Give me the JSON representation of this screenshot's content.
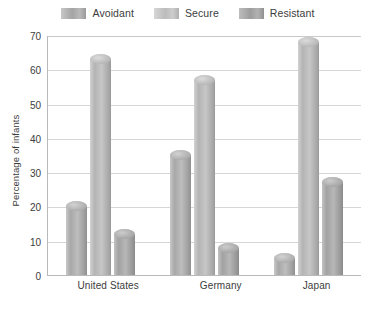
{
  "chart_data": {
    "type": "bar",
    "title": "",
    "xlabel": "",
    "ylabel": "Percentage of infants",
    "ylim": [
      0,
      70
    ],
    "yticks": [
      70,
      60,
      50,
      40,
      30,
      20,
      10,
      0
    ],
    "grid": true,
    "legend_position": "top-center",
    "categories": [
      "United States",
      "Germany",
      "Japan"
    ],
    "series": [
      {
        "name": "Avoidant",
        "values": [
          20,
          35,
          5
        ],
        "color": "#a8a8a8"
      },
      {
        "name": "Secure",
        "values": [
          63,
          57,
          68
        ],
        "color": "#bcbcbc"
      },
      {
        "name": "Resistant",
        "values": [
          12,
          8,
          27
        ],
        "color": "#9d9d9d"
      }
    ]
  },
  "legend": {
    "items": [
      {
        "label": "Avoidant",
        "swatch": "legend-swatch-avoidant"
      },
      {
        "label": "Secure",
        "swatch": "legend-swatch-secure"
      },
      {
        "label": "Resistant",
        "swatch": "legend-swatch-resistant"
      }
    ]
  },
  "axes": {
    "y_title": "Percentage of infants",
    "y_tick_labels": [
      "70",
      "60",
      "50",
      "40",
      "30",
      "20",
      "10",
      "0"
    ],
    "x_tick_labels": [
      "United States",
      "Germany",
      "Japan"
    ]
  }
}
